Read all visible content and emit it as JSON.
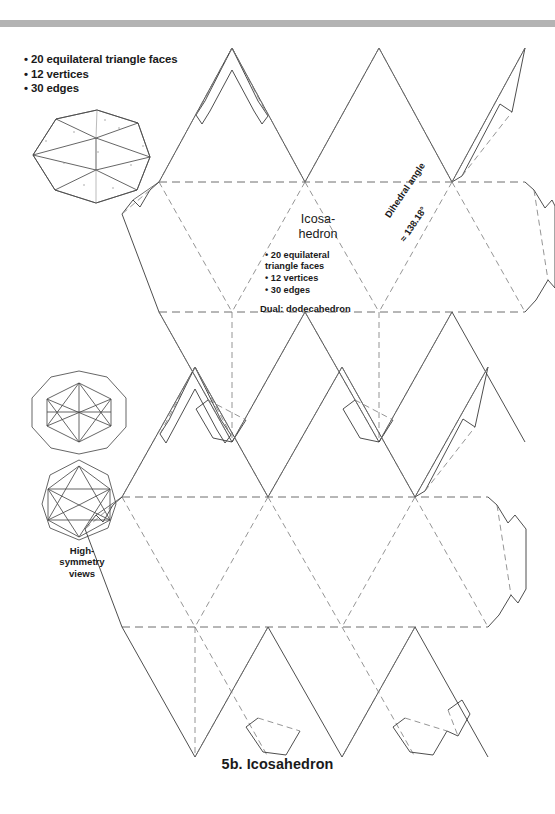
{
  "page": {
    "caption": "5b. Icosahedron",
    "accent_bar_color": "#b3b3b3",
    "line_color": "#3a3a3a",
    "fold_color": "#6e6e6e",
    "background": "#ffffff"
  },
  "facts_top": {
    "line1": "• 20 equilateral triangle faces",
    "line2": "• 12 vertices",
    "line3": "• 30 edges"
  },
  "center_label": {
    "title_line1": "Icosa-",
    "title_line2": "hedron",
    "fact1": "• 20 equilateral",
    "fact2": "triangle faces",
    "fact3": "• 12 vertices",
    "fact4": "• 30 edges",
    "dual": "Dual: dodecahedron"
  },
  "dihedral": {
    "label": "Dihedral angle",
    "value": "≈ 138.18°"
  },
  "high_symmetry": {
    "line1": "High-",
    "line2": "symmetry",
    "line3": "views"
  }
}
